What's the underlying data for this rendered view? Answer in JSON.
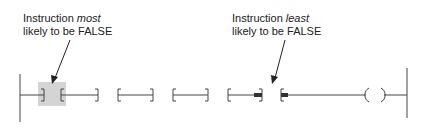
{
  "diagram": {
    "type": "ladder-logic-rung",
    "annotations": [
      {
        "id": "most",
        "line1_prefix": "Instruction ",
        "line1_emphasis": "most",
        "line2": "likely to be FALSE",
        "target": "instruction-1"
      },
      {
        "id": "least",
        "line1_prefix": "Instruction ",
        "line1_emphasis": "least",
        "line2": "likely to be FALSE",
        "target": "instruction-4"
      }
    ],
    "instructions": [
      {
        "index": 1,
        "kind": "contact",
        "highlighted": true
      },
      {
        "index": 2,
        "kind": "contact",
        "highlighted": false
      },
      {
        "index": 3,
        "kind": "contact",
        "highlighted": false
      },
      {
        "index": 4,
        "kind": "contact",
        "highlighted": false,
        "bold_ends": true
      },
      {
        "index": 5,
        "kind": "output-coil"
      }
    ],
    "colors": {
      "line": "#444444",
      "highlight": "#d4d4d4",
      "text": "#222222"
    }
  }
}
